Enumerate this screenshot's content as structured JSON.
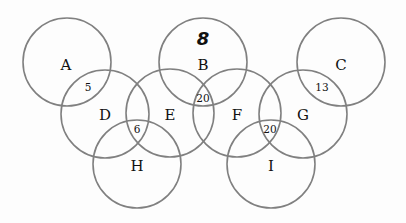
{
  "diagram": {
    "type": "overlapping-circles",
    "stroke_color": "#808080",
    "radius": 44,
    "circles": [
      {
        "id": "A",
        "label": "A",
        "cx": 67,
        "cy": 62
      },
      {
        "id": "B",
        "label": "B",
        "cx": 203,
        "cy": 62
      },
      {
        "id": "C",
        "label": "C",
        "cx": 341,
        "cy": 62
      },
      {
        "id": "D",
        "label": "D",
        "cx": 105,
        "cy": 114
      },
      {
        "id": "E",
        "label": "E",
        "cx": 170,
        "cy": 113
      },
      {
        "id": "F",
        "label": "F",
        "cx": 237,
        "cy": 113
      },
      {
        "id": "G",
        "label": "G",
        "cx": 303,
        "cy": 114
      },
      {
        "id": "H",
        "label": "H",
        "cx": 137,
        "cy": 164
      },
      {
        "id": "I",
        "label": "I",
        "cx": 271,
        "cy": 164
      }
    ],
    "labels": [
      {
        "text": "A",
        "x": 66,
        "y": 66
      },
      {
        "text": "B",
        "x": 203,
        "y": 66
      },
      {
        "text": "C",
        "x": 341,
        "y": 66
      },
      {
        "text": "D",
        "x": 105,
        "y": 116
      },
      {
        "text": "E",
        "x": 170,
        "y": 116
      },
      {
        "text": "F",
        "x": 237,
        "y": 116
      },
      {
        "text": "G",
        "x": 303,
        "y": 116
      },
      {
        "text": "H",
        "x": 137,
        "y": 167
      },
      {
        "text": "I",
        "x": 271,
        "y": 167
      }
    ],
    "intersection_counts": [
      {
        "regions": "A∩D",
        "text": "5",
        "x": 88,
        "y": 88
      },
      {
        "regions": "B∩E∩F",
        "text": "20",
        "x": 203,
        "y": 99
      },
      {
        "regions": "C∩G",
        "text": "13",
        "x": 322,
        "y": 88
      },
      {
        "regions": "D∩E∩H",
        "text": "6",
        "x": 137,
        "y": 130
      },
      {
        "regions": "F∩G∩I",
        "text": "20",
        "x": 270,
        "y": 130
      }
    ],
    "annotation": {
      "text": "8",
      "x": 203,
      "y": 40,
      "note": "handwritten inside circle B"
    }
  }
}
